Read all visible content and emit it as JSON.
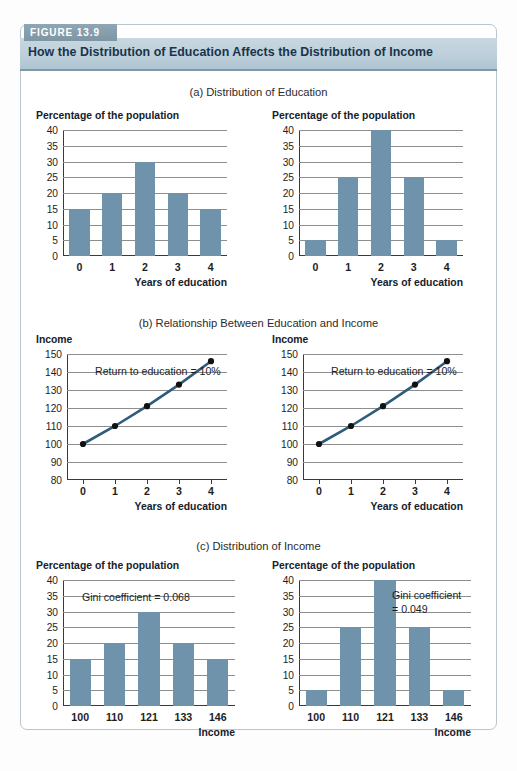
{
  "figure": {
    "tab_label": "FIGURE 13.9",
    "title": "How the Distribution of Education Affects the Distribution of Income",
    "accent_color": "#6e93ab",
    "line_color": "#2e5c7a",
    "header_color": "#bdcfda",
    "tab_color": "#8299a8"
  },
  "sections": {
    "a": {
      "caption": "(a) Distribution of Education"
    },
    "b": {
      "caption": "(b) Relationship Between Education and Income"
    },
    "c": {
      "caption": "(c) Distribution of Income"
    }
  },
  "axis_titles": {
    "percentage": "Percentage of the population",
    "income": "Income",
    "years_of_education": "Years of education",
    "income_axis": "Income"
  },
  "notes": {
    "return_left": "Return to education = 10%",
    "return_right": "Return to education = 10%",
    "gini_left": "Gini coefficient = 0.068",
    "gini_right_line1": "Gini coefficient",
    "gini_right_line2": "= 0.049"
  },
  "chart_data": [
    {
      "id": "a-left",
      "type": "bar",
      "title": "Percentage of the population",
      "xlabel": "Years of education",
      "ylabel": "Percentage of the population",
      "categories": [
        "0",
        "1",
        "2",
        "3",
        "4"
      ],
      "values": [
        15,
        20,
        30,
        20,
        15
      ],
      "ylim": [
        0,
        40
      ],
      "yticks": [
        0,
        5,
        10,
        15,
        20,
        25,
        30,
        35,
        40
      ],
      "grid": true,
      "legend": "none"
    },
    {
      "id": "a-right",
      "type": "bar",
      "title": "Percentage of the population",
      "xlabel": "Years of education",
      "ylabel": "Percentage of the population",
      "categories": [
        "0",
        "1",
        "2",
        "3",
        "4"
      ],
      "values": [
        5,
        25,
        40,
        25,
        5
      ],
      "ylim": [
        0,
        40
      ],
      "yticks": [
        0,
        5,
        10,
        15,
        20,
        25,
        30,
        35,
        40
      ],
      "grid": true,
      "legend": "none"
    },
    {
      "id": "b-left",
      "type": "line",
      "title": "Income",
      "xlabel": "Years of education",
      "ylabel": "Income",
      "x": [
        0,
        1,
        2,
        3,
        4
      ],
      "values": [
        100,
        110,
        121,
        133,
        146
      ],
      "ylim": [
        80,
        150
      ],
      "yticks": [
        80,
        90,
        100,
        110,
        120,
        130,
        140,
        150
      ],
      "annotation": "Return to education = 10%",
      "grid": true,
      "legend": "none"
    },
    {
      "id": "b-right",
      "type": "line",
      "title": "Income",
      "xlabel": "Years of education",
      "ylabel": "Income",
      "x": [
        0,
        1,
        2,
        3,
        4
      ],
      "values": [
        100,
        110,
        121,
        133,
        146
      ],
      "ylim": [
        80,
        150
      ],
      "yticks": [
        80,
        90,
        100,
        110,
        120,
        130,
        140,
        150
      ],
      "annotation": "Return to education = 10%",
      "grid": true,
      "legend": "none"
    },
    {
      "id": "c-left",
      "type": "bar",
      "title": "Percentage of the population",
      "xlabel": "Income",
      "ylabel": "Percentage of the population",
      "categories": [
        "100",
        "110",
        "121",
        "133",
        "146"
      ],
      "values": [
        15,
        20,
        30,
        20,
        15
      ],
      "ylim": [
        0,
        40
      ],
      "yticks": [
        0,
        5,
        10,
        15,
        20,
        25,
        30,
        35,
        40
      ],
      "annotation": "Gini coefficient = 0.068",
      "grid": true,
      "legend": "none"
    },
    {
      "id": "c-right",
      "type": "bar",
      "title": "Percentage of the population",
      "xlabel": "Income",
      "ylabel": "Percentage of the population",
      "categories": [
        "100",
        "110",
        "121",
        "133",
        "146"
      ],
      "values": [
        5,
        25,
        40,
        25,
        5
      ],
      "ylim": [
        0,
        40
      ],
      "yticks": [
        0,
        5,
        10,
        15,
        20,
        25,
        30,
        35,
        40
      ],
      "annotation": "Gini coefficient = 0.049",
      "grid": true,
      "legend": "none"
    }
  ]
}
